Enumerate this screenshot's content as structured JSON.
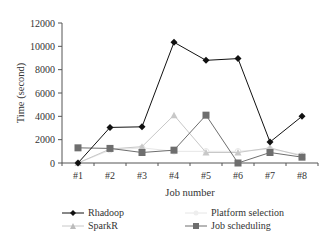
{
  "chart_data": {
    "type": "line",
    "title": "",
    "xlabel": "Job number",
    "ylabel": "Time (second)",
    "categories": [
      "#1",
      "#2",
      "#3",
      "#4",
      "#5",
      "#6",
      "#7",
      "#8"
    ],
    "ylim": [
      0,
      12000
    ],
    "yticks": [
      0,
      2000,
      4000,
      6000,
      8000,
      10000,
      12000
    ],
    "grid": false,
    "legend_position": "bottom",
    "series": [
      {
        "name": "Rhadoop",
        "marker": "diamond",
        "color": "#111111",
        "values": [
          0,
          3050,
          3100,
          10350,
          8800,
          8950,
          1800,
          4000
        ]
      },
      {
        "name": "SparkR",
        "marker": "triangle",
        "color": "#c8c8c8",
        "values": [
          0,
          1200,
          1400,
          4100,
          900,
          900,
          1300,
          600
        ]
      },
      {
        "name": "Platform selection",
        "marker": "circle",
        "color": "#e6e6e6",
        "values": [
          0,
          1100,
          1300,
          1000,
          1000,
          1000,
          1200,
          700
        ]
      },
      {
        "name": "Job scheduling",
        "marker": "square",
        "color": "#6e6e6e",
        "values": [
          1300,
          1250,
          900,
          1100,
          4100,
          0,
          900,
          500
        ]
      }
    ]
  },
  "legend": {
    "items": [
      "Rhadoop",
      "SparkR",
      "Platform selection",
      "Job scheduling"
    ]
  }
}
